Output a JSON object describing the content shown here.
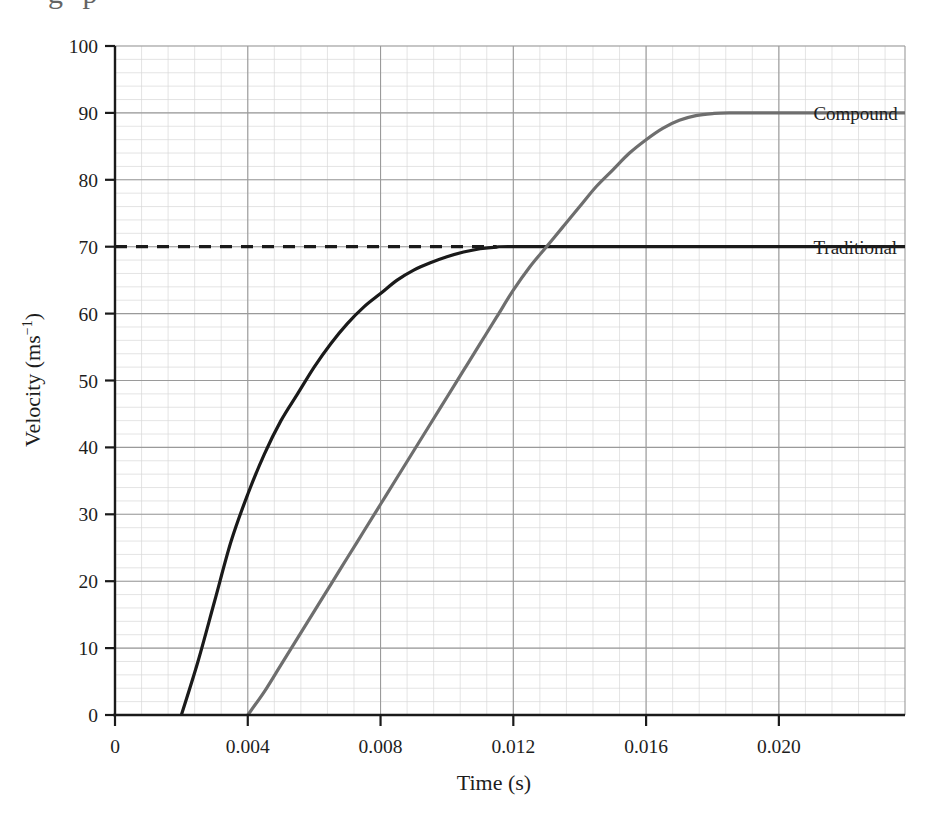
{
  "figure": {
    "clipped_header_fragment": "g p",
    "background_color": "#ffffff"
  },
  "axes": {
    "x": {
      "title": "Time (s)",
      "tick_labels": [
        "0",
        "0.004",
        "0.008",
        "0.012",
        "0.016",
        "0.020"
      ],
      "tick_values": [
        0,
        0.004,
        0.008,
        0.012,
        0.016,
        0.02
      ],
      "range": [
        0,
        0.0238
      ],
      "minor_ticks_per_major": 4
    },
    "y": {
      "title_main": "Velocity (ms",
      "title_sup": "−1",
      "title_close": ")",
      "title_plain": "Velocity (ms⁻¹)",
      "tick_labels": [
        "0",
        "10",
        "20",
        "30",
        "40",
        "50",
        "60",
        "70",
        "80",
        "90",
        "100"
      ],
      "tick_values": [
        0,
        10,
        20,
        30,
        40,
        50,
        60,
        70,
        80,
        90,
        100
      ],
      "range": [
        0,
        100
      ],
      "minor_ticks_per_major": 4
    }
  },
  "grid": {
    "major_color": "#9a9a9a",
    "minor_color": "#d8d8d8",
    "enabled": true
  },
  "annotations": {
    "reference_line": {
      "label": "",
      "value": 70,
      "style": "dashed",
      "color": "#1a1a1a",
      "x_start": 0.0,
      "x_end": 0.0115
    }
  },
  "chart_data": {
    "type": "line",
    "title": "",
    "xlabel": "Time (s)",
    "ylabel": "Velocity (ms⁻¹)",
    "xlim": [
      0,
      0.0238
    ],
    "ylim": [
      0,
      100
    ],
    "grid": true,
    "legend_position": "right-inline-labels",
    "series": [
      {
        "name": "Traditional",
        "color": "#1a1a1a",
        "label_x": 0.0208,
        "label_y": 70,
        "plateau_value": 70,
        "points": [
          [
            0.002,
            0
          ],
          [
            0.0025,
            8
          ],
          [
            0.003,
            17
          ],
          [
            0.0035,
            26
          ],
          [
            0.004,
            33
          ],
          [
            0.0045,
            39
          ],
          [
            0.005,
            44
          ],
          [
            0.0055,
            48
          ],
          [
            0.006,
            52
          ],
          [
            0.0065,
            55.5
          ],
          [
            0.007,
            58.5
          ],
          [
            0.0075,
            61
          ],
          [
            0.008,
            63
          ],
          [
            0.0085,
            65
          ],
          [
            0.009,
            66.5
          ],
          [
            0.0095,
            67.6
          ],
          [
            0.01,
            68.5
          ],
          [
            0.0105,
            69.2
          ],
          [
            0.011,
            69.7
          ],
          [
            0.0115,
            69.95
          ],
          [
            0.012,
            70
          ],
          [
            0.016,
            70
          ],
          [
            0.02,
            70
          ],
          [
            0.0238,
            70
          ]
        ]
      },
      {
        "name": "Compound",
        "color": "#6e6e6e",
        "label_x": 0.0208,
        "label_y": 90,
        "plateau_value": 90,
        "points": [
          [
            0.004,
            0
          ],
          [
            0.0045,
            3.5
          ],
          [
            0.005,
            7.5
          ],
          [
            0.0055,
            11.5
          ],
          [
            0.006,
            15.5
          ],
          [
            0.0065,
            19.5
          ],
          [
            0.007,
            23.5
          ],
          [
            0.0075,
            27.5
          ],
          [
            0.008,
            31.5
          ],
          [
            0.0085,
            35.5
          ],
          [
            0.009,
            39.5
          ],
          [
            0.0095,
            43.5
          ],
          [
            0.01,
            47.5
          ],
          [
            0.0105,
            51.5
          ],
          [
            0.011,
            55.5
          ],
          [
            0.0115,
            59.5
          ],
          [
            0.012,
            63.5
          ],
          [
            0.0125,
            67
          ],
          [
            0.013,
            70
          ],
          [
            0.0135,
            73
          ],
          [
            0.014,
            76
          ],
          [
            0.0145,
            79
          ],
          [
            0.015,
            81.5
          ],
          [
            0.0155,
            84
          ],
          [
            0.016,
            86
          ],
          [
            0.0165,
            87.7
          ],
          [
            0.017,
            88.9
          ],
          [
            0.0175,
            89.6
          ],
          [
            0.018,
            89.9
          ],
          [
            0.0185,
            90
          ],
          [
            0.02,
            90
          ],
          [
            0.0238,
            90
          ]
        ]
      }
    ],
    "annotations": [
      {
        "type": "dashed-reference-line",
        "y": 70,
        "x_from": 0,
        "x_to": 0.0115,
        "text": ""
      }
    ]
  }
}
